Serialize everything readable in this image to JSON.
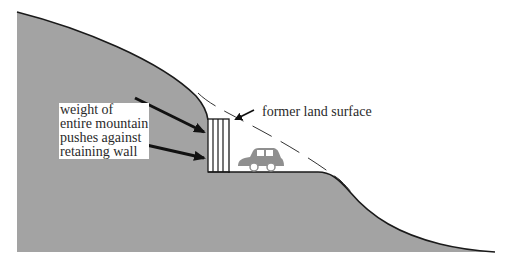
{
  "labels": {
    "weight_lines": [
      "weight of",
      "entire mountain",
      "pushes against",
      "retaining wall"
    ],
    "former_surface": "former land surface"
  },
  "colors": {
    "ground": "#a3a3a3",
    "outline": "#1a1a1a",
    "wall_fill": "#ffffff",
    "car": "#8f8f8f",
    "background": "#ffffff"
  },
  "elements": {
    "mountain": "hillside cross-section",
    "retaining_wall": "retaining wall",
    "car": "car on road",
    "former_surface_line": "dashed former land surface"
  }
}
